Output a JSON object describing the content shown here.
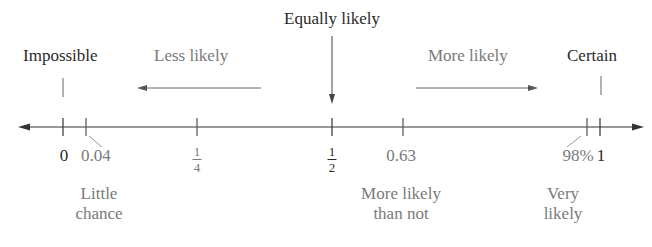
{
  "colors": {
    "primary_text": "#2a2a2a",
    "secondary_text": "#7a7a7a",
    "axis": "#333333"
  },
  "top_labels": {
    "equally_likely": "Equally likely",
    "impossible": "Impossible",
    "less_likely": "Less likely",
    "more_likely": "More likely",
    "certain": "Certain"
  },
  "ticks": [
    {
      "id": "zero",
      "label": "0",
      "value": 0
    },
    {
      "id": "little",
      "label": "0.04",
      "value": 0.04
    },
    {
      "id": "quarter",
      "numerator": "1",
      "denominator": "4",
      "value": 0.25
    },
    {
      "id": "half",
      "numerator": "1",
      "denominator": "2",
      "value": 0.5
    },
    {
      "id": "more_than_not",
      "label": "0.63",
      "value": 0.63
    },
    {
      "id": "very",
      "label": "98%",
      "value": 0.98
    },
    {
      "id": "one",
      "label": "1",
      "value": 1
    }
  ],
  "bottom_labels": {
    "little_chance": [
      "Little",
      "chance"
    ],
    "more_likely_than_not": [
      "More likely",
      "than not"
    ],
    "very_likely": [
      "Very",
      "likely"
    ]
  }
}
